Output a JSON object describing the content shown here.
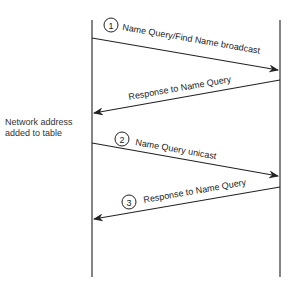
{
  "diagram": {
    "type": "sequence",
    "participants": [
      "left-host",
      "right-host"
    ],
    "note": {
      "line1": "Network address",
      "line2": "added to table"
    },
    "messages": [
      {
        "step": "1",
        "label": "Name Query/Find Name broadcast",
        "direction": "left-to-right"
      },
      {
        "step": "",
        "label": "Response to Name Query",
        "direction": "right-to-left"
      },
      {
        "step": "2",
        "label": "Name Query unicast",
        "direction": "left-to-right"
      },
      {
        "step": "3",
        "label": "Response to Name Query",
        "direction": "right-to-left"
      }
    ],
    "colors": {
      "line": "#222222",
      "text": "#222222"
    }
  }
}
